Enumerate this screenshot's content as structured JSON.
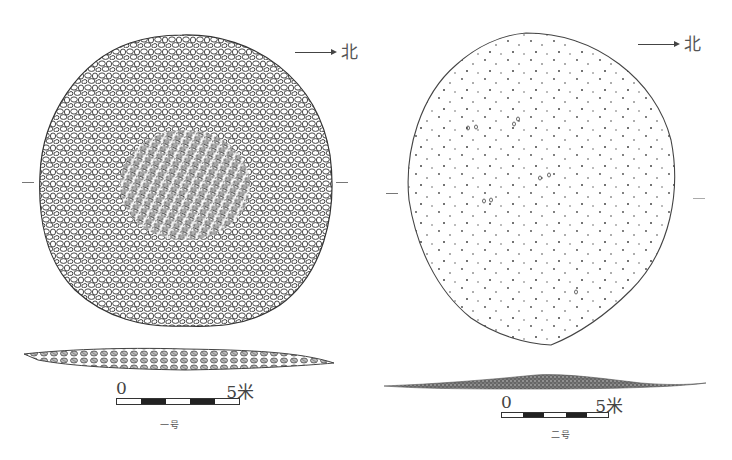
{
  "figure": {
    "panels": [
      {
        "id": "feature-1",
        "caption": "一号",
        "north_label": "北",
        "fill": "dense cobbles",
        "scale": {
          "start": "0",
          "end": "5米",
          "segments": 5
        }
      },
      {
        "id": "feature-2",
        "caption": "二号",
        "north_label": "北",
        "fill": "scattered stones",
        "scale": {
          "start": "0",
          "end": "5米",
          "segments": 5
        }
      }
    ]
  }
}
